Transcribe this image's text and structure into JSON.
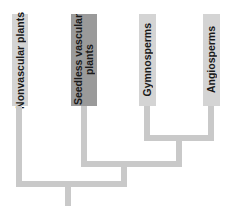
{
  "diagram": {
    "type": "cladogram",
    "taxa": [
      {
        "label": "Nonvascular plants",
        "highlighted": false
      },
      {
        "label": "Seedless vascular\nplants",
        "highlighted": true
      },
      {
        "label": "Gymnosperms",
        "highlighted": false
      },
      {
        "label": "Angiosperms",
        "highlighted": false
      }
    ],
    "colors": {
      "box_default": "#d4d4d4",
      "box_highlight": "#9a9a9a",
      "branch": "#c9c9c9",
      "text": "#1a1a1a"
    }
  }
}
